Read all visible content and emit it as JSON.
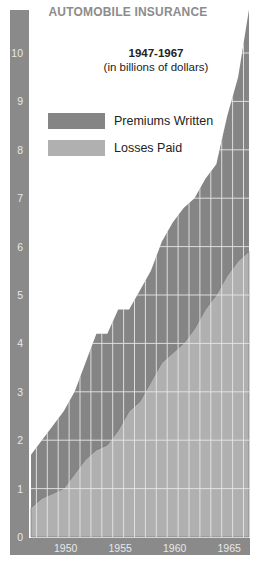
{
  "header": {
    "title": "AUTOMOBILE INSURANCE",
    "subtitle_years": "1947-1967",
    "subtitle_units": "(in billions of dollars)"
  },
  "legend": [
    {
      "label": "Premiums Written",
      "color": "#858585"
    },
    {
      "label": "Losses Paid",
      "color": "#b0b0b0"
    }
  ],
  "colors": {
    "axis_band": "#8a8a8a",
    "premiums": "#858585",
    "losses": "#b0b0b0",
    "grid": "#e6e6e6",
    "tick_text": "#e8e8e8"
  },
  "chart_data": {
    "type": "area",
    "title": "AUTOMOBILE INSURANCE",
    "subtitle": "1947-1967 (in billions of dollars)",
    "xlabel": "",
    "ylabel": "",
    "x": [
      1947,
      1948,
      1949,
      1950,
      1951,
      1952,
      1953,
      1954,
      1955,
      1956,
      1957,
      1958,
      1959,
      1960,
      1961,
      1962,
      1963,
      1964,
      1965,
      1966,
      1967
    ],
    "x_tick_labels": [
      "1950",
      "1955",
      "1960",
      "1965"
    ],
    "y_tick_labels": [
      "0",
      "1",
      "2",
      "3",
      "4",
      "5",
      "6",
      "7",
      "8",
      "9",
      "10"
    ],
    "ylim": [
      0,
      11
    ],
    "grid": true,
    "legend_position": "upper-left",
    "series": [
      {
        "name": "Premiums Written",
        "values": [
          1.7,
          2.0,
          2.3,
          2.6,
          3.0,
          3.6,
          4.2,
          4.2,
          4.7,
          4.7,
          5.1,
          5.5,
          6.1,
          6.5,
          6.8,
          7.0,
          7.4,
          7.7,
          8.7,
          9.5,
          10.9
        ]
      },
      {
        "name": "Losses Paid",
        "values": [
          0.6,
          0.8,
          0.9,
          1.0,
          1.3,
          1.6,
          1.8,
          1.9,
          2.2,
          2.6,
          2.8,
          3.2,
          3.6,
          3.8,
          4.0,
          4.3,
          4.7,
          5.0,
          5.4,
          5.7,
          5.9
        ]
      }
    ]
  }
}
